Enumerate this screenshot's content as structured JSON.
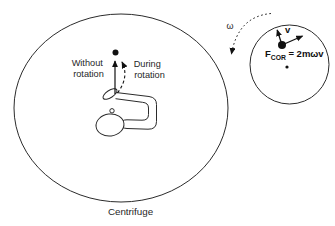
{
  "diagram": {
    "type": "physics-diagram",
    "colors": {
      "background": "#ffffff",
      "line": "#2b2b2b",
      "text": "#1f1f1f",
      "dot": "#111111"
    },
    "centrifuge": {
      "label": "Centrifuge",
      "without_rotation": {
        "line1": "Without",
        "line2": "rotation"
      },
      "during_rotation": {
        "line1": "During",
        "line2": "rotation"
      }
    },
    "inset": {
      "omega": "ω",
      "velocity": "v",
      "force_symbol": "F",
      "force_subscript": "COR",
      "force_equation": "= 2mωv"
    }
  }
}
